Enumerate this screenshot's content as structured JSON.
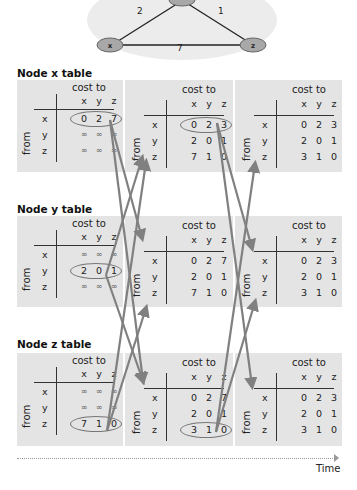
{
  "network": {
    "nodes": [
      "x",
      "y",
      "z"
    ],
    "links": [
      {
        "from": "x",
        "to": "y",
        "cost": "2"
      },
      {
        "from": "y",
        "to": "z",
        "cost": "1"
      },
      {
        "from": "x",
        "to": "z",
        "cost": "7"
      }
    ]
  },
  "labels": {
    "cost_to": "cost to",
    "from": "from",
    "cols": [
      "x",
      "y",
      "z"
    ],
    "rows": [
      "x",
      "y",
      "z"
    ],
    "time": "Time"
  },
  "sections": [
    {
      "title": "Node x table",
      "tables": [
        {
          "rows": [
            [
              "0",
              "2",
              "7"
            ],
            [
              "∞",
              "∞",
              "∞"
            ],
            [
              "∞",
              "∞",
              "∞"
            ]
          ],
          "highlight_row": 0
        },
        {
          "rows": [
            [
              "0",
              "2",
              "3"
            ],
            [
              "2",
              "0",
              "1"
            ],
            [
              "7",
              "1",
              "0"
            ]
          ],
          "highlight_row": 0
        },
        {
          "rows": [
            [
              "0",
              "2",
              "3"
            ],
            [
              "2",
              "0",
              "1"
            ],
            [
              "3",
              "1",
              "0"
            ]
          ],
          "highlight_row": -1
        }
      ]
    },
    {
      "title": "Node y table",
      "tables": [
        {
          "rows": [
            [
              "∞",
              "∞",
              "∞"
            ],
            [
              "2",
              "0",
              "1"
            ],
            [
              "∞",
              "∞",
              "∞"
            ]
          ],
          "highlight_row": 1
        },
        {
          "rows": [
            [
              "0",
              "2",
              "7"
            ],
            [
              "2",
              "0",
              "1"
            ],
            [
              "7",
              "1",
              "0"
            ]
          ],
          "highlight_row": -1
        },
        {
          "rows": [
            [
              "0",
              "2",
              "3"
            ],
            [
              "2",
              "0",
              "1"
            ],
            [
              "3",
              "1",
              "0"
            ]
          ],
          "highlight_row": -1
        }
      ]
    },
    {
      "title": "Node z table",
      "tables": [
        {
          "rows": [
            [
              "∞",
              "∞",
              "∞"
            ],
            [
              "∞",
              "∞",
              "∞"
            ],
            [
              "7",
              "1",
              "0"
            ]
          ],
          "highlight_row": 2
        },
        {
          "rows": [
            [
              "0",
              "2",
              "7"
            ],
            [
              "2",
              "0",
              "1"
            ],
            [
              "3",
              "1",
              "0"
            ]
          ],
          "highlight_row": 2
        },
        {
          "rows": [
            [
              "0",
              "2",
              "3"
            ],
            [
              "2",
              "0",
              "1"
            ],
            [
              "3",
              "1",
              "0"
            ]
          ],
          "highlight_row": -1
        }
      ]
    }
  ],
  "colors": {
    "panel": "#e4e4e4",
    "arrow": "#808080",
    "ellipse": "#777777"
  }
}
